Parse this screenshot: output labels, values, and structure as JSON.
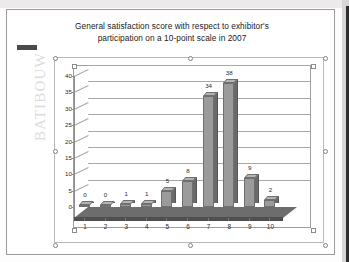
{
  "document": {
    "watermark": "BATIBOUW",
    "logo_chip": "batibouw-logo-chip"
  },
  "chart_data": {
    "type": "bar",
    "title": "General satisfaction score with respect to exhibitor's participation on a 10-point scale in 2007",
    "title_lines": [
      "General satisfaction score with respect to exhibitor's",
      "participation on a 10-point scale in 2007"
    ],
    "categories": [
      "1",
      "2",
      "3",
      "4",
      "5",
      "6",
      "7",
      "8",
      "9",
      "10"
    ],
    "values": [
      0,
      0,
      1,
      1,
      5,
      8,
      34,
      38,
      9,
      2
    ],
    "data_labels": [
      "0",
      "0",
      "1",
      "1",
      "5",
      "8",
      "34",
      "38",
      "9",
      "2"
    ],
    "xlabel": "",
    "ylabel": "",
    "ylim": [
      0,
      40
    ],
    "ytick_labels": [
      "0",
      "5",
      "10",
      "15",
      "20",
      "25",
      "30",
      "35",
      "40"
    ],
    "ytick_values": [
      0,
      5,
      10,
      15,
      20,
      25,
      30,
      35,
      40
    ],
    "grid": true,
    "legend": false,
    "style": "3d-column",
    "series_color": "#9b9b9b",
    "gridline_color": "#a8a8a8",
    "floor_color": "#6d6d6d",
    "text_color": "#1a1a1a"
  }
}
